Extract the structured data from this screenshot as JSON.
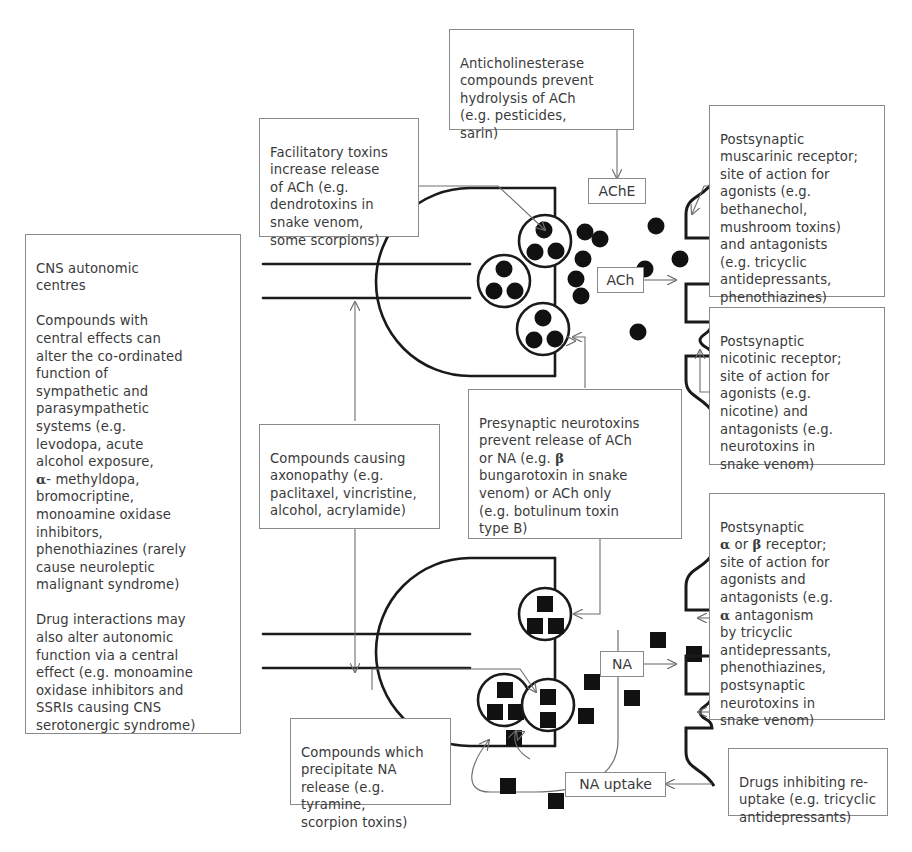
{
  "boxes": {
    "cns": {
      "label": "CNS autonomic centres",
      "text": "CNS autonomic\ncentres\n\nCompounds with\ncentral effects can\nalter the co-ordinated\nfunction of\nsympathetic and\nparasympathetic\nsystems (e.g.\nlevodopa, acute\nalcohol exposure,\nα- methyldopa,\nbromocriptine,\nmonoamine oxidase\ninhibitors,\nphenothiazines (rarely\ncause neuroleptic\nmalignant syndrome)\n\nDrug interactions may\nalso alter autonomic\nfunction via a central\neffect (e.g. monoamine\noxidase inhibitors and\nSSRIs causing CNS\nserotonergic syndrome)"
    },
    "facilitatory": {
      "label": "Facilitatory toxins",
      "text": "Facilitatory toxins\nincrease release\nof ACh (e.g.\ndendrotoxins in\nsnake venom,\nsome scorpions)"
    },
    "anticholinesterase": {
      "label": "Anticholinesterase compounds",
      "text": "Anticholinesterase\ncompounds prevent\nhydrolysis of ACh\n(e.g. pesticides,\nsarin)"
    },
    "muscarinic": {
      "label": "Postsynaptic muscarinic receptor",
      "text": "Postsynaptic\nmuscarinic receptor;\nsite of action for\nagonists (e.g.\nbethanechol,\nmushroom toxins)\nand antagonists\n(e.g. tricyclic\nantidepressants,\nphenothiazines)"
    },
    "nicotinic": {
      "label": "Postsynaptic nicotinic receptor",
      "text": "Postsynaptic\nnicotinic receptor;\nsite of action for\nagonists (e.g.\nnicotine) and\nantagonists (e.g.\nneurotoxins in\nsnake venom)"
    },
    "axonopathy": {
      "label": "Compounds causing axonopathy",
      "text": "Compounds causing\naxonopathy (e.g.\npaclitaxel, vincristine,\nalcohol, acrylamide)"
    },
    "presynaptic": {
      "label": "Presynaptic neurotoxins",
      "text": "Presynaptic neurotoxins\nprevent release of ACh\nor NA (e.g. β\nbungarotoxin in snake\nvenom) or ACh only\n(e.g. botulinum toxin\ntype B)"
    },
    "alphabeta": {
      "label": "Postsynaptic alpha or beta receptor",
      "text": "Postsynaptic\nα or β receptor;\nsite of action for\nagonists and\nantagonists (e.g.\nα antagonism\nby tricyclic\nantidepressants,\nphenothiazines,\npostsynaptic\nneurotoxins in\nsnake venom)"
    },
    "precipitate": {
      "label": "Compounds which precipitate NA release",
      "text": "Compounds which\nprecipitate NA\nrelease (e.g. tyramine,\nscorpion toxins)"
    },
    "reuptake": {
      "label": "Drugs inhibiting re-uptake",
      "text": "Drugs inhibiting re-\nuptake (e.g. tricyclic\nantidepressants)"
    }
  },
  "tags": {
    "ache": "AChE",
    "ach": "ACh",
    "na": "NA",
    "na_uptake": "NA uptake"
  },
  "colors": {
    "ink": "#1a1a1a",
    "box_border": "#8a8a8a",
    "text": "#3a3a3a",
    "wire": "#6f6f6f",
    "background": "#ffffff"
  },
  "chart_data": {
    "type": "diagram",
    "synapses": [
      {
        "name": "cholinergic-synapse",
        "transmitter": "ACh",
        "enzyme": "AChE",
        "vesicle_count": 3,
        "vesicle_granule_shape": "circle",
        "free_transmitter_particles": 9,
        "receptors": [
          "muscarinic",
          "nicotinic"
        ]
      },
      {
        "name": "noradrenergic-synapse",
        "transmitter": "NA",
        "reuptake": "NA uptake",
        "vesicle_count": 3,
        "vesicle_granule_shape": "square",
        "free_transmitter_particles": 9,
        "receptors": [
          "alpha",
          "beta"
        ]
      }
    ]
  }
}
